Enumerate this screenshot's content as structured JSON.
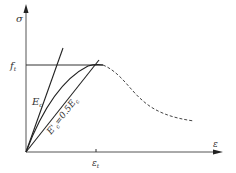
{
  "diagram": {
    "y_axis_label": "σ",
    "x_axis_label": "ε",
    "peak_stress_label": "f",
    "peak_stress_subscript": "t",
    "peak_strain_label": "ε",
    "peak_strain_subscript": "t",
    "initial_modulus_label": "E",
    "initial_modulus_subscript": "c",
    "secant_modulus_label": "E'",
    "secant_modulus_subscript": "c",
    "secant_modulus_eq": "=0.5E",
    "secant_modulus_eq_subscript": "c",
    "colors": {
      "line": "#333333",
      "dashed": "#444444"
    }
  }
}
